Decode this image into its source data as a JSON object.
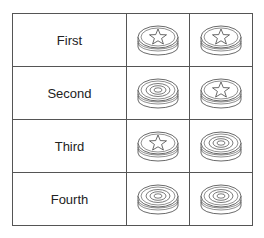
{
  "rows": [
    {
      "label": "First",
      "pieces": [
        "star",
        "star"
      ]
    },
    {
      "label": "Second",
      "pieces": [
        "rings",
        "star"
      ]
    },
    {
      "label": "Third",
      "pieces": [
        "star",
        "rings"
      ]
    },
    {
      "label": "Fourth",
      "pieces": [
        "rings",
        "rings"
      ]
    }
  ],
  "colors": {
    "grid_line": "#555555",
    "piece_stroke": "#444444",
    "background": "#ffffff"
  }
}
